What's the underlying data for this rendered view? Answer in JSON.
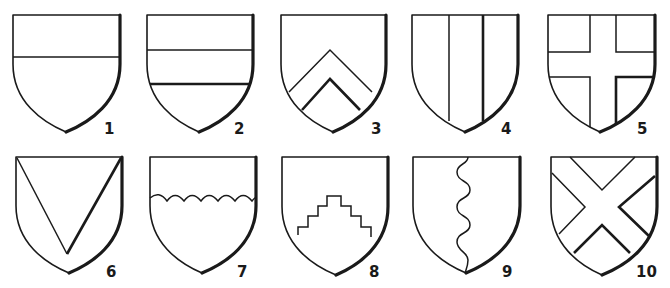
{
  "figure": {
    "title": "",
    "ink_color": "#1a1a1a",
    "background_color": "#ffffff"
  },
  "shields": [
    {
      "number": "1",
      "name": "shield-1",
      "division": "chief / party per fess",
      "left": 13,
      "right": 120,
      "top": 15,
      "tip_x": 66,
      "tip_y": 132,
      "label_x": 104,
      "label_y": 134,
      "charges": [
        {
          "d": "M13 57 L120 57",
          "heavy": false
        }
      ]
    },
    {
      "number": "2",
      "name": "shield-2",
      "division": "fess",
      "left": 147,
      "right": 253,
      "top": 15,
      "tip_x": 199,
      "tip_y": 132,
      "label_x": 234,
      "label_y": 134,
      "charges": [
        {
          "d": "M147 50 L253 50",
          "heavy": false
        },
        {
          "d": "M150 84 L251 84",
          "heavy": true
        }
      ]
    },
    {
      "number": "3",
      "name": "shield-3",
      "division": "chevron",
      "left": 281,
      "right": 386,
      "top": 15,
      "tip_x": 333,
      "tip_y": 132,
      "label_x": 371,
      "label_y": 134,
      "charges": [
        {
          "d": "M289 92 L330 50 L372 92",
          "heavy": false
        },
        {
          "d": "M302 110 L330 79 L360 110",
          "heavy": true
        }
      ]
    },
    {
      "number": "4",
      "name": "shield-4",
      "division": "pale",
      "left": 412,
      "right": 518,
      "top": 15,
      "tip_x": 465,
      "tip_y": 132,
      "label_x": 501,
      "label_y": 134,
      "charges": [
        {
          "d": "M449 15 L449 121",
          "heavy": false
        },
        {
          "d": "M483 15 L483 121",
          "heavy": true
        }
      ]
    },
    {
      "number": "5",
      "name": "shield-5",
      "division": "cross",
      "left": 548,
      "right": 655,
      "top": 15,
      "tip_x": 600,
      "tip_y": 132,
      "label_x": 637,
      "label_y": 134,
      "charges": [
        {
          "d": "M590 15 L590 52 L548 52",
          "heavy": false
        },
        {
          "d": "M616 15 L616 52 L655 52",
          "heavy": false
        },
        {
          "d": "M549 77 L590 77 L590 127",
          "heavy": false
        },
        {
          "d": "M616 125 L616 77 L654 77",
          "heavy": true
        }
      ]
    },
    {
      "number": "6",
      "name": "shield-6",
      "division": "chevron reversed / pile",
      "left": 16,
      "right": 122,
      "top": 157,
      "tip_x": 69,
      "tip_y": 273,
      "label_x": 106,
      "label_y": 277,
      "charges": [
        {
          "d": "M17 158 L67 254",
          "heavy": false
        },
        {
          "d": "M67 254 L121 158",
          "heavy": true
        }
      ]
    },
    {
      "number": "7",
      "name": "shield-7",
      "division": "per fess invected",
      "left": 150,
      "right": 256,
      "top": 157,
      "tip_x": 202,
      "tip_y": 273,
      "label_x": 237,
      "label_y": 277,
      "charges": [
        {
          "d": "M150 198 Q159 190 167 201 Q175 190 184 201 Q192 190 201 201 Q209 190 218 201 Q226 190 235 201 Q243 190 252 201 Q255 197 256 198",
          "heavy": false
        }
      ]
    },
    {
      "number": "8",
      "name": "shield-8",
      "division": "per fess embattled grady",
      "left": 282,
      "right": 388,
      "top": 157,
      "tip_x": 336,
      "tip_y": 275,
      "label_x": 369,
      "label_y": 277,
      "charges": [
        {
          "d": "M298 235 L298 227 L308 227 L308 216 L318 216 L318 206 L327 206 L327 196 L341 196 L341 206 L351 206 L351 216 L361 216 L361 227 L371 227 L371 237",
          "heavy": false
        }
      ]
    },
    {
      "number": "9",
      "name": "shield-9",
      "division": "per pale nebuly / wavy",
      "left": 413,
      "right": 520,
      "top": 157,
      "tip_x": 466,
      "tip_y": 273,
      "label_x": 502,
      "label_y": 277,
      "charges": [
        {
          "d": "M468 157 C468 165 457 163 457 172 C457 182 470 180 470 190 C470 199 457 197 457 207 C457 217 470 215 470 225 C470 234 457 232 457 242 C457 251 468 252 468 260 C468 266 466 270 465 273",
          "heavy": false
        }
      ]
    },
    {
      "number": "10",
      "name": "shield-10",
      "division": "saltire",
      "left": 551,
      "right": 657,
      "top": 157,
      "tip_x": 602,
      "tip_y": 275,
      "label_x": 636,
      "label_y": 277,
      "charges": [
        {
          "d": "M570 157 L602 190 L635 157",
          "heavy": false
        },
        {
          "d": "M552 173 L585 207 L559 234",
          "heavy": false
        },
        {
          "d": "M655 176 L619 207 L650 237",
          "heavy": true
        },
        {
          "d": "M574 253 L602 225 L630 253",
          "heavy": true
        }
      ]
    }
  ]
}
